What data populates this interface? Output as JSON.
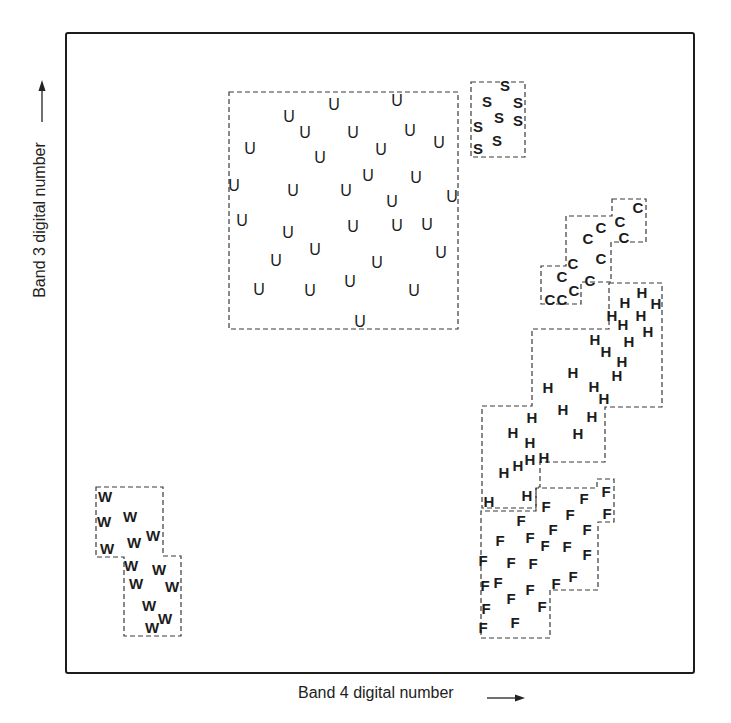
{
  "chart_data": {
    "type": "scatter",
    "title": "",
    "xlabel": "Band 4 digital number",
    "ylabel": "Band 3 digital number",
    "axis_ticks": "none",
    "grid": false,
    "legend": "none (class letters plotted directly)",
    "coordinate_note": "Points given in screenshot pixel coordinates (x right, y down) since axes carry no numeric ticks.",
    "classes": [
      {
        "letter": "U",
        "name": "U class",
        "boundary": [
          [
            229,
            92
          ],
          [
            458,
            92
          ],
          [
            458,
            329
          ],
          [
            229,
            329
          ]
        ],
        "points": [
          [
            289,
            116
          ],
          [
            334,
            104
          ],
          [
            397,
            100
          ],
          [
            305,
            132
          ],
          [
            353,
            132
          ],
          [
            410,
            130
          ],
          [
            439,
            142
          ],
          [
            250,
            148
          ],
          [
            320,
            157
          ],
          [
            381,
            149
          ],
          [
            234,
            185
          ],
          [
            293,
            190
          ],
          [
            346,
            190
          ],
          [
            368,
            175
          ],
          [
            416,
            177
          ],
          [
            452,
            196
          ],
          [
            392,
            201
          ],
          [
            242,
            220
          ],
          [
            288,
            232
          ],
          [
            353,
            226
          ],
          [
            397,
            225
          ],
          [
            427,
            224
          ],
          [
            276,
            260
          ],
          [
            315,
            249
          ],
          [
            377,
            262
          ],
          [
            441,
            252
          ],
          [
            259,
            289
          ],
          [
            310,
            290
          ],
          [
            350,
            281
          ],
          [
            414,
            290
          ],
          [
            360,
            321
          ]
        ]
      },
      {
        "letter": "S",
        "name": "S class",
        "boundary": [
          [
            471,
            82
          ],
          [
            525,
            82
          ],
          [
            525,
            157
          ],
          [
            471,
            157
          ]
        ],
        "points": [
          [
            505,
            85
          ],
          [
            487,
            101
          ],
          [
            518,
            102
          ],
          [
            499,
            117
          ],
          [
            518,
            120
          ],
          [
            478,
            126
          ],
          [
            497,
            140
          ],
          [
            478,
            148
          ]
        ]
      },
      {
        "letter": "C",
        "name": "C class",
        "boundary": [
          [
            612,
            199
          ],
          [
            646,
            199
          ],
          [
            646,
            242
          ],
          [
            611,
            242
          ],
          [
            611,
            282
          ],
          [
            581,
            282
          ],
          [
            581,
            304
          ],
          [
            541,
            304
          ],
          [
            541,
            266
          ],
          [
            566,
            266
          ],
          [
            566,
            216
          ],
          [
            612,
            216
          ]
        ],
        "points": [
          [
            638,
            207
          ],
          [
            601,
            227
          ],
          [
            620,
            221
          ],
          [
            588,
            238
          ],
          [
            624,
            237
          ],
          [
            601,
            258
          ],
          [
            573,
            263
          ],
          [
            562,
            276
          ],
          [
            590,
            280
          ],
          [
            574,
            290
          ],
          [
            550,
            299
          ],
          [
            562,
            299
          ]
        ]
      },
      {
        "letter": "H",
        "name": "H class",
        "boundary": [
          [
            609,
            283
          ],
          [
            662,
            283
          ],
          [
            662,
            407
          ],
          [
            605,
            407
          ],
          [
            605,
            462
          ],
          [
            540,
            462
          ],
          [
            540,
            487
          ],
          [
            536,
            487
          ],
          [
            536,
            508
          ],
          [
            482,
            508
          ],
          [
            482,
            406
          ],
          [
            532,
            406
          ],
          [
            532,
            329
          ],
          [
            609,
            329
          ]
        ],
        "points": [
          [
            642,
            292
          ],
          [
            625,
            302
          ],
          [
            656,
            303
          ],
          [
            612,
            315
          ],
          [
            641,
            315
          ],
          [
            623,
            324
          ],
          [
            648,
            331
          ],
          [
            595,
            339
          ],
          [
            629,
            341
          ],
          [
            606,
            351
          ],
          [
            622,
            361
          ],
          [
            573,
            372
          ],
          [
            617,
            375
          ],
          [
            548,
            387
          ],
          [
            594,
            386
          ],
          [
            604,
            398
          ],
          [
            563,
            409
          ],
          [
            592,
            416
          ],
          [
            532,
            417
          ],
          [
            578,
            433
          ],
          [
            513,
            432
          ],
          [
            530,
            442
          ],
          [
            518,
            465
          ],
          [
            530,
            459
          ],
          [
            544,
            457
          ],
          [
            504,
            472
          ],
          [
            527,
            495
          ],
          [
            489,
            501
          ]
        ]
      },
      {
        "letter": "F",
        "name": "F class",
        "boundary": [
          [
            597,
            479
          ],
          [
            614,
            479
          ],
          [
            614,
            522
          ],
          [
            598,
            522
          ],
          [
            598,
            590
          ],
          [
            550,
            590
          ],
          [
            550,
            638
          ],
          [
            481,
            638
          ],
          [
            481,
            511
          ],
          [
            536,
            511
          ],
          [
            536,
            488
          ],
          [
            597,
            488
          ]
        ],
        "points": [
          [
            606,
            491
          ],
          [
            584,
            498
          ],
          [
            546,
            506
          ],
          [
            521,
            520
          ],
          [
            570,
            514
          ],
          [
            607,
            513
          ],
          [
            553,
            529
          ],
          [
            587,
            529
          ],
          [
            500,
            540
          ],
          [
            530,
            537
          ],
          [
            545,
            545
          ],
          [
            567,
            546
          ],
          [
            587,
            554
          ],
          [
            483,
            560
          ],
          [
            511,
            562
          ],
          [
            533,
            563
          ],
          [
            573,
            576
          ],
          [
            556,
            583
          ],
          [
            485,
            585
          ],
          [
            498,
            582
          ],
          [
            511,
            598
          ],
          [
            530,
            589
          ],
          [
            486,
            608
          ],
          [
            542,
            606
          ],
          [
            515,
            622
          ],
          [
            483,
            627
          ]
        ]
      },
      {
        "letter": "W",
        "name": "W class",
        "boundary": [
          [
            96,
            487
          ],
          [
            163,
            487
          ],
          [
            163,
            556
          ],
          [
            181,
            556
          ],
          [
            181,
            636
          ],
          [
            124,
            636
          ],
          [
            124,
            557
          ],
          [
            96,
            557
          ]
        ],
        "points": [
          [
            105,
            496
          ],
          [
            130,
            516
          ],
          [
            104,
            521
          ],
          [
            153,
            535
          ],
          [
            134,
            542
          ],
          [
            107,
            548
          ],
          [
            131,
            565
          ],
          [
            159,
            569
          ],
          [
            136,
            583
          ],
          [
            172,
            586
          ],
          [
            149,
            605
          ],
          [
            165,
            618
          ],
          [
            152,
            627
          ]
        ]
      }
    ]
  },
  "labels": {
    "xlabel": "Band 4 digital number",
    "ylabel": "Band 3 digital number"
  }
}
